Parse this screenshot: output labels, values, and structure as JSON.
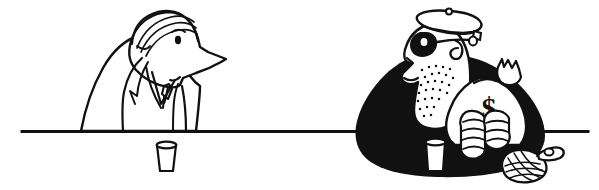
{
  "illustration": {
    "title": "Bank robber and bank teller at a counter",
    "style": "black-and-white line-art cartoon",
    "background_color": "#ffffff",
    "ink_color": "#111111",
    "canvas": {
      "width": 599,
      "height": 190
    }
  },
  "scene": {
    "counter": {
      "name": "counter-line",
      "description": "Horizontal bar counter line",
      "y": 131,
      "x_start": 22,
      "x_end": 588,
      "thickness": 3,
      "color": "#111111"
    },
    "objects": [
      {
        "name": "cup-left",
        "label": "Drinking cup",
        "x": 156,
        "y": 144,
        "width": 20,
        "height": 28,
        "fill": "#ffffff"
      },
      {
        "name": "cup-right",
        "label": "Drinking cup",
        "x": 425,
        "y": 140,
        "width": 20,
        "height": 30,
        "fill": "#ffffff"
      },
      {
        "name": "hand-grenade",
        "label": "Hand grenade with pull ring",
        "x": 498,
        "y": 150,
        "width": 56,
        "height": 34,
        "fill": "#ffffff"
      }
    ],
    "figures": [
      {
        "name": "figure-teller",
        "label": "Bank teller",
        "side": "left",
        "fill_style": "white with black outline",
        "features": [
          "comb-over hair",
          "large pointed nose",
          "small dot eye",
          "suit jacket with lapels",
          "shirt collar",
          "necktie"
        ]
      },
      {
        "name": "figure-robber",
        "label": "Robber",
        "side": "right",
        "fill_style": "solid black body with white face",
        "features": [
          "flat cap",
          "black eye mask",
          "curl of hair",
          "stubbled chin",
          "raised gloved hand",
          "two hands gripping money bag"
        ]
      }
    ],
    "money_bag": {
      "name": "money-bag",
      "label": "Sack of money",
      "symbol": "$",
      "fill": "#ffffff",
      "outline": "#111111"
    }
  }
}
